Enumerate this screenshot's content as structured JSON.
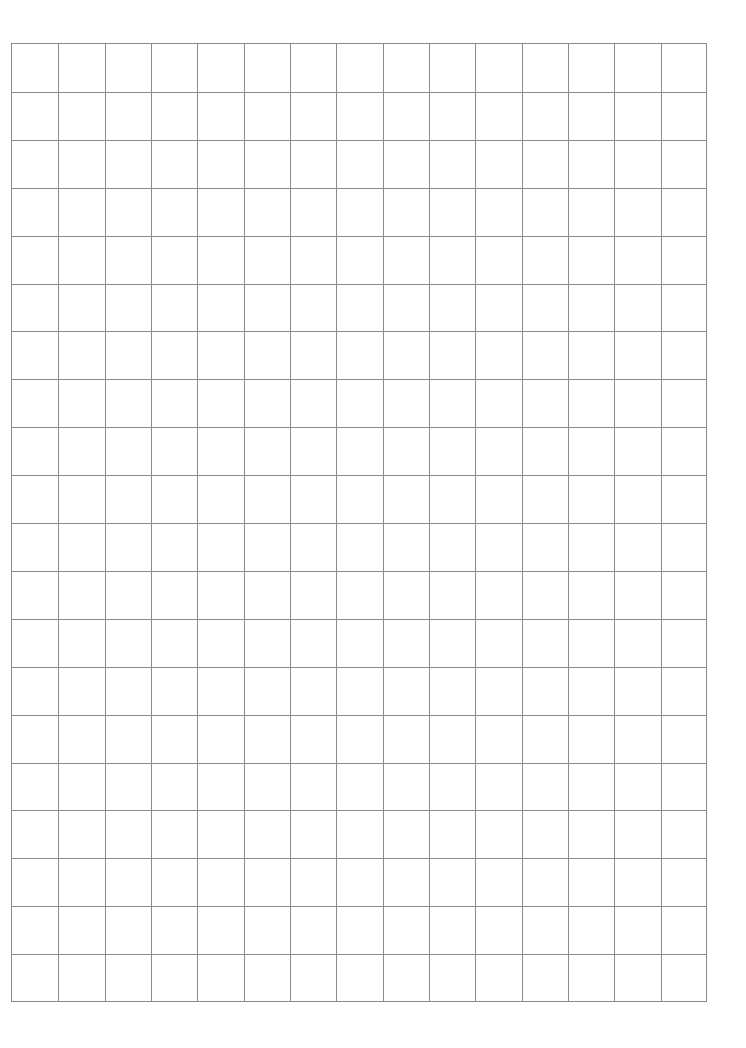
{
  "page": {
    "type": "graph-paper",
    "background": "#ffffff"
  },
  "grid": {
    "columns": 15,
    "rows": 20,
    "line_color": "#8a8a8a",
    "left": 11,
    "top": 43,
    "width": 696,
    "height": 959
  }
}
